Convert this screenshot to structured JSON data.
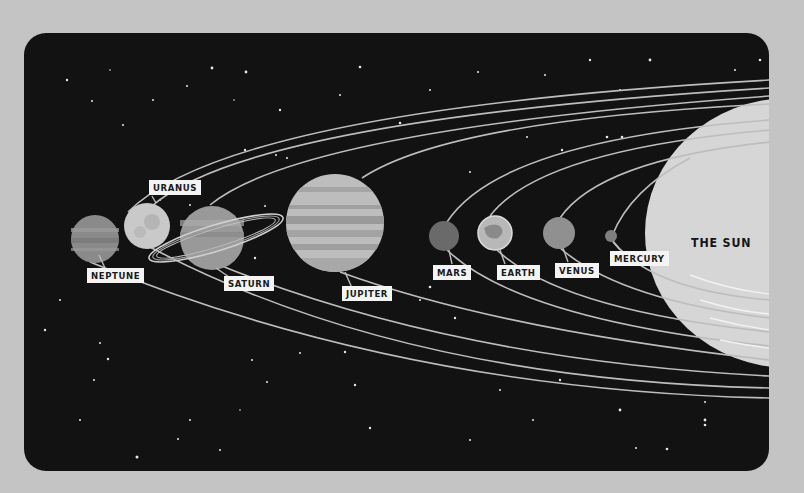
{
  "illustration": {
    "title": "Solar System",
    "sun": {
      "label": "THE SUN"
    },
    "planets": [
      {
        "name": "neptune",
        "label": "NEPTUNE"
      },
      {
        "name": "uranus",
        "label": "URANUS"
      },
      {
        "name": "saturn",
        "label": "SATURN"
      },
      {
        "name": "jupiter",
        "label": "JUPITER"
      },
      {
        "name": "mars",
        "label": "MARS"
      },
      {
        "name": "earth",
        "label": "EARTH"
      },
      {
        "name": "venus",
        "label": "VENUS"
      },
      {
        "name": "mercury",
        "label": "MERCURY"
      }
    ],
    "colors": {
      "page_background": "#c4c4c4",
      "space": "#121212",
      "orbit": "#bdbdbd",
      "sun": "#d6d6d6",
      "label_bg": "#f4f4f4",
      "label_text": "#1a1a1a"
    }
  }
}
